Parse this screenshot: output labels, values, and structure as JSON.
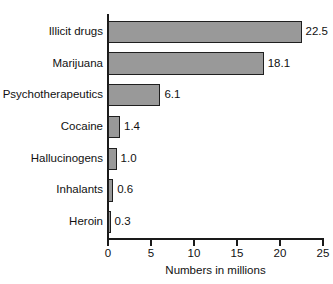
{
  "chart_data": {
    "type": "bar",
    "orientation": "horizontal",
    "title": "",
    "xlabel": "Numbers in millions",
    "ylabel": "",
    "categories": [
      "Illicit drugs",
      "Marijuana",
      "Psychotherapeutics",
      "Cocaine",
      "Hallucinogens",
      "Inhalants",
      "Heroin"
    ],
    "values": [
      22.5,
      18.1,
      6.1,
      1.4,
      1.0,
      0.6,
      0.3
    ],
    "value_labels": [
      "22.5",
      "18.1",
      "6.1",
      "1.4",
      "1.0",
      "0.6",
      "0.3"
    ],
    "xlim": [
      0,
      25
    ],
    "xticks": [
      0,
      5,
      10,
      15,
      20,
      25
    ],
    "xtick_labels": [
      "0",
      "5",
      "10",
      "15",
      "20",
      "25"
    ],
    "grid": false,
    "legend": false,
    "bar_fill_color": "#999999",
    "bar_border_color": "#1f1f1f",
    "axis_color": "#1a1a1a",
    "text_color": "#111111",
    "background_color": "#ffffff"
  }
}
